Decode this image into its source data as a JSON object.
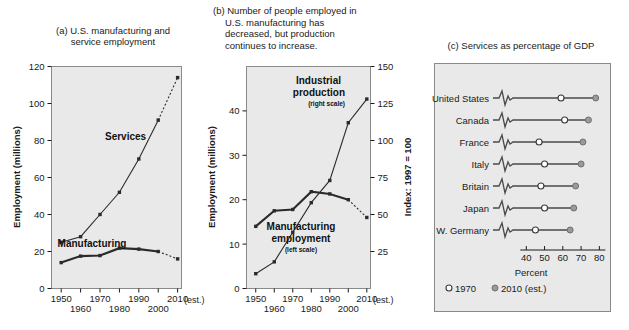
{
  "figure": {
    "width": 629,
    "height": 330,
    "background": "#ffffff",
    "plot_fill": "#e9e9e9"
  },
  "panel_a": {
    "title_line1": "(a) U.S. manufacturing and",
    "title_line2": "service employment",
    "y_axis_title": "Employment (millions)",
    "x_est_note": "(est.)",
    "label_services": "Services",
    "label_manufacturing": "Manufacturing"
  },
  "panel_b": {
    "title_line1": "(b) Number of people employed in",
    "title_line2": "U.S. manufacturing has",
    "title_line3": "decreased, but production",
    "title_line4": "continues to increase.",
    "y_axis_title_left": "Employment (millions)",
    "y_axis_title_right": "Index: 1997 = 100",
    "x_est_note": "(est.)",
    "label_industrial": "Industrial",
    "label_production": "production",
    "label_right_scale": "(right scale)",
    "label_manufacturing": "Manufacturing",
    "label_employment": "employment",
    "label_left_scale": "(left scale)"
  },
  "panel_c": {
    "title": "(c) Services as percentage of GDP",
    "x_axis_title": "Percent",
    "legend_1970": "1970",
    "legend_2010": "2010 (est.)"
  },
  "chart_data": [
    {
      "id": "panel-a",
      "type": "line",
      "title": "(a) U.S. manufacturing and service employment",
      "xlabel": "",
      "ylabel": "Employment (millions)",
      "x": [
        1950,
        1960,
        1970,
        1980,
        1990,
        2000,
        2010
      ],
      "xlim": [
        1945,
        2012
      ],
      "ylim": [
        0,
        120
      ],
      "yticks": [
        0,
        20,
        40,
        60,
        80,
        100,
        120
      ],
      "xticks": [
        1950,
        1960,
        1970,
        1980,
        1990,
        2000,
        2010
      ],
      "grid": false,
      "legend": "inline-annotations",
      "series": [
        {
          "name": "Services",
          "values": [
            25,
            28,
            40,
            52,
            70,
            91,
            114
          ],
          "last_segment_dashed": true
        },
        {
          "name": "Manufacturing",
          "values": [
            14,
            17.5,
            17.8,
            21.8,
            21.3,
            20,
            16
          ],
          "last_segment_dashed": true
        }
      ]
    },
    {
      "id": "panel-b",
      "type": "line",
      "title": "(b) Number of people employed in U.S. manufacturing has decreased, but production continues to increase.",
      "xlabel": "",
      "ylabel_left": "Employment (millions)",
      "ylabel_right": "Index: 1997 = 100",
      "x": [
        1950,
        1960,
        1970,
        1980,
        1990,
        2000,
        2010
      ],
      "xlim": [
        1945,
        2012
      ],
      "ylim_left": [
        0,
        50
      ],
      "yticks_left": [
        0,
        10,
        20,
        30,
        40
      ],
      "ylim_right": [
        0,
        150
      ],
      "yticks_right": [
        25,
        50,
        75,
        100,
        125,
        150
      ],
      "xticks": [
        1950,
        1960,
        1970,
        1980,
        1990,
        2000,
        2010
      ],
      "grid": false,
      "series": [
        {
          "name": "Manufacturing employment (left scale)",
          "scale": "left",
          "values": [
            14,
            17.5,
            17.8,
            21.8,
            21.3,
            20,
            16
          ],
          "last_segment_dashed": true
        },
        {
          "name": "Industrial production (right scale)",
          "scale": "right",
          "values": [
            10,
            18,
            38,
            58,
            73,
            112,
            128
          ],
          "last_segment_dashed": false
        }
      ]
    },
    {
      "id": "panel-c",
      "type": "dot-plot",
      "title": "(c) Services as percentage of GDP",
      "xlabel": "Percent",
      "xlim": [
        36,
        82
      ],
      "xticks": [
        40,
        50,
        60,
        70,
        80
      ],
      "axis_break": true,
      "categories": [
        "United States",
        "Canada",
        "France",
        "Italy",
        "Britain",
        "Japan",
        "W. Germany"
      ],
      "series": [
        {
          "name": "1970",
          "marker": "open-circle",
          "values": [
            59,
            61,
            47,
            50,
            48,
            50,
            45
          ]
        },
        {
          "name": "2010 (est.)",
          "marker": "filled-circle",
          "values": [
            78,
            74,
            71,
            70,
            67,
            66,
            64
          ]
        }
      ]
    }
  ]
}
